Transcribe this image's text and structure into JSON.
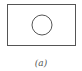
{
  "figure": {
    "caption": "(a)",
    "shapes": [
      {
        "type": "rectangle",
        "x": 7,
        "y": 4,
        "width": 69,
        "height": 42
      },
      {
        "type": "circle",
        "cx": 42,
        "cy": 25,
        "r": 10
      }
    ],
    "stroke_color": "#555555"
  }
}
